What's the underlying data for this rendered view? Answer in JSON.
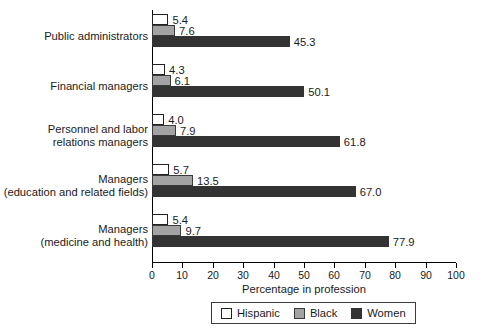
{
  "chart_data": {
    "type": "bar",
    "orientation": "horizontal",
    "title": "",
    "xlabel": "Percentage in profession",
    "ylabel": "",
    "xlim": [
      0,
      100
    ],
    "xticks": [
      0,
      10,
      20,
      30,
      40,
      50,
      60,
      70,
      80,
      90,
      100
    ],
    "grid": false,
    "legend_position": "bottom",
    "categories": [
      "Public administrators",
      "Financial managers",
      "Personnel and labor\nrelations managers",
      "Managers\n(education and related fields)",
      "Managers\n(medicine and health)"
    ],
    "series": [
      {
        "name": "Hispanic",
        "color": "#ffffff",
        "values": [
          5.4,
          4.3,
          4.0,
          5.7,
          5.4
        ],
        "labels": [
          "5.4",
          "4.3",
          "4.0",
          "5.7",
          "5.4"
        ]
      },
      {
        "name": "Black",
        "color": "#a3a3a3",
        "values": [
          7.6,
          6.1,
          7.9,
          13.5,
          9.7
        ],
        "labels": [
          "7.6",
          "6.1",
          "7.9",
          "13.5",
          "9.7"
        ]
      },
      {
        "name": "Women",
        "color": "#333333",
        "values": [
          45.3,
          50.1,
          61.8,
          67.0,
          77.9
        ],
        "labels": [
          "45.3",
          "50.1",
          "61.8",
          "67.0",
          "77.9"
        ]
      }
    ]
  }
}
